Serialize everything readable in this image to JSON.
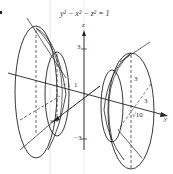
{
  "figure": {
    "equation": "y² − x² − z² = 1",
    "axes": {
      "x_label": "x",
      "y_label": "y",
      "z_label": "z"
    },
    "ticks": {
      "z_pos": "3",
      "z_neg": "−3",
      "y_neg": "−1",
      "y_pos": "1",
      "right_vertical": "3",
      "right_depth": "3",
      "right_y": "√10"
    },
    "colors": {
      "stroke": "#222222",
      "guide": "#d8d8d8"
    }
  }
}
